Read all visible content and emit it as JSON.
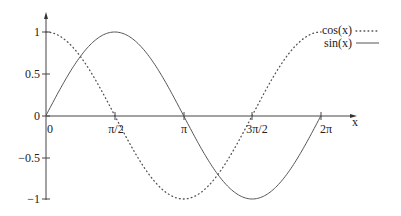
{
  "chart_data": {
    "type": "line",
    "title": "",
    "xlabel": "x",
    "ylabel": "",
    "xlim": [
      0,
      6.2832
    ],
    "ylim": [
      -1,
      1
    ],
    "grid": false,
    "legend_position": "top-right",
    "x_ticks": [
      "0",
      "π/2",
      "π",
      "3π/2",
      "2π"
    ],
    "x_tick_values": [
      0,
      1.5708,
      3.1416,
      4.7124,
      6.2832
    ],
    "y_ticks": [
      "1",
      "0.5",
      "0",
      "-0.5",
      "-1"
    ],
    "y_tick_values": [
      1,
      0.5,
      0,
      -0.5,
      -1
    ],
    "x": [
      0,
      0.7854,
      1.5708,
      2.3562,
      3.1416,
      3.927,
      4.7124,
      5.4978,
      6.2832
    ],
    "series": [
      {
        "name": "cos(x)",
        "style": "dotted",
        "values": [
          1,
          0.707,
          0,
          -0.707,
          -1,
          -0.707,
          0,
          0.707,
          1
        ]
      },
      {
        "name": "sin(x)",
        "style": "solid",
        "values": [
          0,
          0.707,
          1,
          0.707,
          0,
          -0.707,
          -1,
          -0.707,
          0
        ]
      }
    ]
  },
  "legend": {
    "items": [
      {
        "label": "cos(x)",
        "style": "dotted"
      },
      {
        "label": "sin(x)",
        "style": "solid"
      }
    ]
  },
  "axes": {
    "x_label": "x",
    "x_ticks": [
      "0",
      "π/2",
      "π",
      "3π/2",
      "2π"
    ],
    "y_ticks": [
      "1",
      "0.5",
      "0",
      "−0.5",
      "−1"
    ]
  },
  "colors": {
    "line": "#444444",
    "axis": "#444444",
    "text": "#222222"
  }
}
